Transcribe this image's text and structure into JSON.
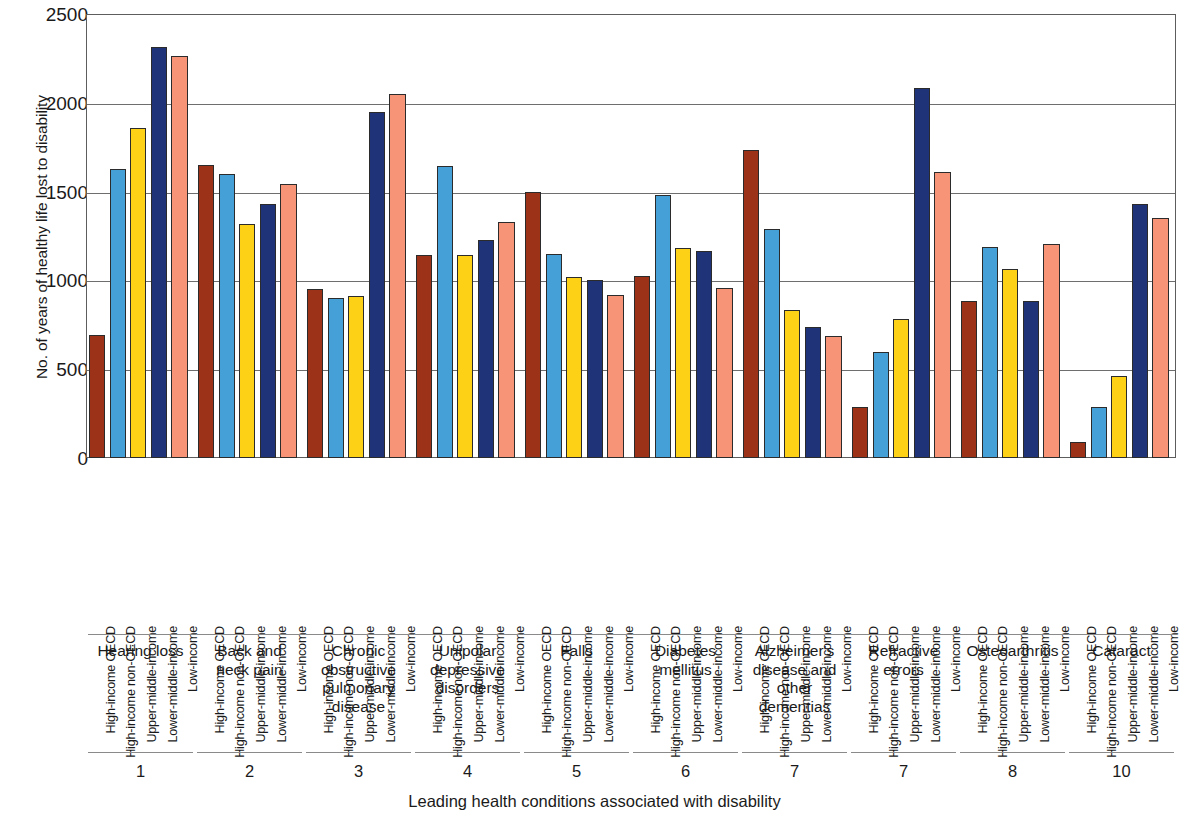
{
  "axes": {
    "y_title": "No. of years of healthy life lost to disability",
    "x_title": "Leading health conditions associated with disability",
    "y_ticks": [
      "2500",
      "2000",
      "1500",
      "1000",
      "500",
      "0"
    ]
  },
  "series_colors": {
    "High-income OECD": "#9C3218",
    "High-income non-OECD": "#45A0D8",
    "Upper-middle-income": "#FCD116",
    "Lower-middle-income": "#1F3478",
    "Low-income": "#F79477"
  },
  "chart_data": {
    "type": "bar",
    "title": "",
    "subtitle": "",
    "xlabel": "Leading health conditions associated with disability",
    "ylabel": "No. of years of healthy life lost to disability",
    "ylim": [
      0,
      2500
    ],
    "yticks": [
      0,
      500,
      1000,
      1500,
      2000,
      2500
    ],
    "grid": true,
    "legend_position": "none",
    "grouping": "grouped-bars-by-condition",
    "categories": [
      "Hearing loss",
      "Back and neck pain",
      "Chronic obstructive pulmonary disease",
      "Unipolar depressive disorders",
      "Falls",
      "Diabetes mellitus",
      "Alzheimer's disease and other dementias",
      "Refractive errors",
      "Osteoarthritis",
      "Cataract"
    ],
    "category_labels_multiline": [
      [
        "Hearing loss"
      ],
      [
        "Back and",
        "neck pain"
      ],
      [
        "Chronic",
        "obstructive",
        "pulmonary",
        "disease"
      ],
      [
        "Unipolar",
        "depressive",
        "disorders"
      ],
      [
        "Falls"
      ],
      [
        "Diabetes",
        "mellitus"
      ],
      [
        "Alzheimer's",
        "disease and",
        "other",
        "dementias"
      ],
      [
        "Refractive",
        "errors"
      ],
      [
        "Osteoarthritis"
      ],
      [
        "Cataract"
      ]
    ],
    "ranks": [
      "1",
      "2",
      "3",
      "4",
      "5",
      "6",
      "7",
      "7",
      "8",
      "10"
    ],
    "series": [
      {
        "name": "High-income OECD",
        "color": "#9C3218",
        "values": [
          690,
          1650,
          950,
          1145,
          1500,
          1025,
          1735,
          290,
          885,
          90
        ]
      },
      {
        "name": "High-income non-OECD",
        "color": "#45A0D8",
        "values": [
          1630,
          1600,
          900,
          1645,
          1150,
          1480,
          1290,
          595,
          1190,
          290
        ]
      },
      {
        "name": "Upper-middle-income",
        "color": "#FCD116",
        "values": [
          1860,
          1320,
          915,
          1145,
          1020,
          1180,
          835,
          780,
          1065,
          460
        ]
      },
      {
        "name": "Lower-middle-income",
        "color": "#1F3478",
        "values": [
          2315,
          1430,
          1950,
          1230,
          1000,
          1165,
          740,
          2085,
          885,
          1430
        ]
      },
      {
        "name": "Low-income",
        "color": "#F79477",
        "values": [
          2265,
          1545,
          2050,
          1330,
          920,
          955,
          685,
          1610,
          1205,
          1350
        ]
      }
    ]
  }
}
